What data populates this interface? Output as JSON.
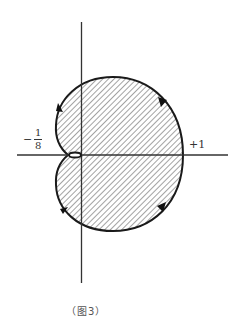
{
  "figure": {
    "caption": "（图3）",
    "labels": {
      "neg_fraction_sign": "−",
      "neg_fraction_numerator": "1",
      "neg_fraction_denominator": "8",
      "positive_one": "+1"
    },
    "axes": {
      "horizontal": {
        "y": 155,
        "x_start": 17,
        "x_end": 228
      },
      "vertical": {
        "x": 81,
        "y_start": 22,
        "y_end": 283
      }
    },
    "curve": {
      "fill": "diagonal-hatch",
      "stroke_color": "#1a1a1a",
      "hatch_color": "#555555",
      "cusp_point": [
        68,
        155
      ],
      "right_extreme": [
        183,
        155
      ],
      "top_extreme": [
        113,
        77
      ],
      "bottom_extreme": [
        113,
        231
      ],
      "arrows": [
        {
          "position": "upper-left",
          "direction": "up"
        },
        {
          "position": "upper-right",
          "direction": "down-right"
        },
        {
          "position": "lower-right",
          "direction": "down-left"
        },
        {
          "position": "lower-left",
          "direction": "up-left"
        }
      ]
    }
  }
}
